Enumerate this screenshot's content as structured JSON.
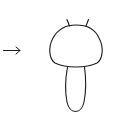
{
  "figure": {
    "stroke_color": "#1a1a1a",
    "background": "#ffffff",
    "elements": [
      {
        "name": "arrow",
        "direction": "right"
      },
      {
        "name": "dome-cap",
        "shape": "rounded dome"
      },
      {
        "name": "antenna-left"
      },
      {
        "name": "antenna-right"
      },
      {
        "name": "stem",
        "shape": "elongated rounded"
      }
    ]
  }
}
